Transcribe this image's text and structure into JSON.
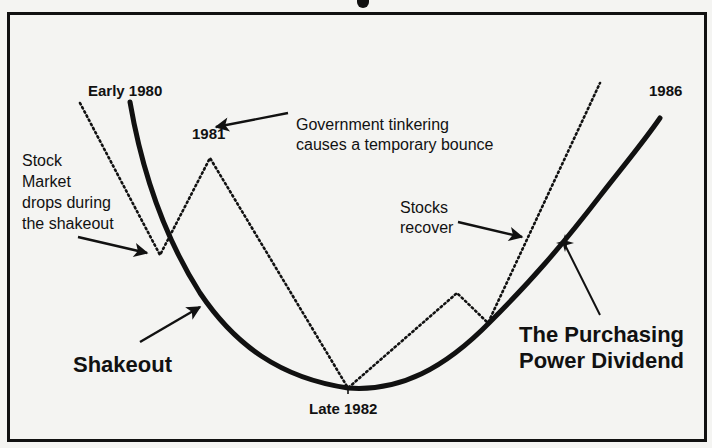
{
  "diagram": {
    "title_fragment": "",
    "labels": {
      "early_1980": "Early 1980",
      "y1981": "1981",
      "government_line1": "Government tinkering",
      "government_line2": "causes a temporary bounce",
      "stock_line1": "Stock",
      "stock_line2": "Market",
      "stock_line3": "drops during",
      "stock_line4": "the shakeout",
      "stocks_recover_line1": "Stocks",
      "stocks_recover_line2": "recover",
      "y1986": "1986",
      "shakeout": "Shakeout",
      "late_1982": "Late 1982",
      "ppd_line1": "The Purchasing",
      "ppd_line2": "Power Dividend"
    },
    "colors": {
      "ink": "#111111",
      "background": "#f4f4f2"
    },
    "series": [
      {
        "name": "Economy (solid curve)",
        "style": "solid",
        "points": [
          [
            130,
            102
          ],
          [
            165,
            238
          ],
          [
            205,
            300
          ],
          [
            260,
            355
          ],
          [
            348,
            388
          ],
          [
            420,
            375
          ],
          [
            490,
            320
          ],
          [
            565,
            242
          ],
          [
            660,
            118
          ]
        ]
      },
      {
        "name": "Stock Market (dotted line)",
        "style": "dotted",
        "points": [
          [
            80,
            103
          ],
          [
            160,
            255
          ],
          [
            210,
            158
          ],
          [
            348,
            388
          ],
          [
            457,
            293
          ],
          [
            488,
            323
          ],
          [
            600,
            83
          ]
        ]
      }
    ]
  }
}
